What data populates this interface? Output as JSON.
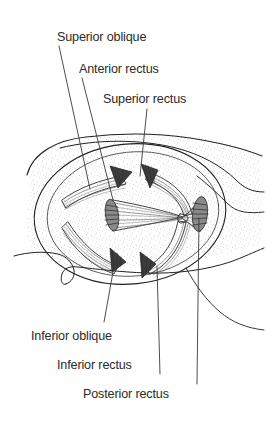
{
  "figure": {
    "background_color": "#ffffff",
    "ink_color": "#222222",
    "text_color": "#2b2b2b"
  },
  "labels": [
    {
      "id": "superior-oblique",
      "text": "Superior oblique",
      "text_x": 57,
      "text_y": 41,
      "anchor": "start",
      "leader": "M 59 46 L 90 189"
    },
    {
      "id": "anterior-rectus",
      "text": "Anterior rectus",
      "text_x": 79,
      "text_y": 73,
      "anchor": "start",
      "leader": "M 82 78 L 113 200"
    },
    {
      "id": "superior-rectus",
      "text": "Superior rectus",
      "text_x": 103,
      "text_y": 103,
      "anchor": "start",
      "leader": "M 147 109 L 140 176"
    },
    {
      "id": "inferior-oblique",
      "text": "Inferior oblique",
      "text_x": 31,
      "text_y": 340,
      "anchor": "start",
      "leader": "M 104 322 L 115 261"
    },
    {
      "id": "inferior-rectus",
      "text": "Inferior rectus",
      "text_x": 57,
      "text_y": 369,
      "anchor": "start",
      "leader": "M 160 374 L 157 266"
    },
    {
      "id": "posterior-rectus",
      "text": "Posterior rectus",
      "text_x": 83,
      "text_y": 398,
      "anchor": "start",
      "leader": "M 197 384 L 199 218"
    }
  ],
  "anatomy": {
    "orbit_rim_label": "orbital-rim",
    "muscle_count": 6,
    "muscle_stumps": [
      {
        "id": "stump-superior-oblique",
        "x": 119,
        "y": 170
      },
      {
        "id": "stump-superior-rectus",
        "x": 148,
        "y": 168
      },
      {
        "id": "stump-inferior-oblique",
        "x": 117,
        "y": 266
      },
      {
        "id": "stump-inferior-rectus",
        "x": 146,
        "y": 270
      }
    ],
    "muscle_discs": [
      {
        "id": "disc-anterior-rectus",
        "cx": 112,
        "cy": 215,
        "rx": 7,
        "ry": 16
      },
      {
        "id": "disc-posterior-rectus",
        "cx": 200,
        "cy": 213,
        "rx": 8,
        "ry": 17
      }
    ],
    "apex": {
      "id": "muscle-apex",
      "x": 183,
      "y": 218
    }
  }
}
